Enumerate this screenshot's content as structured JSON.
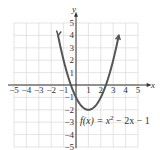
{
  "chart_data": {
    "type": "line",
    "title": "",
    "function_label": "f(x) = x² − 2x − 1",
    "equation": {
      "prefix": "f(x) = x",
      "exp": "2",
      "suffix": " − 2x − 1"
    },
    "xlabel": "x",
    "ylabel": "y",
    "xlim": [
      -5,
      5
    ],
    "ylim": [
      -5,
      5
    ],
    "x_ticks": [
      "−5",
      "−4",
      "−3",
      "−2",
      "−1",
      "1",
      "2",
      "3",
      "4",
      "5"
    ],
    "y_ticks": [
      "5",
      "4",
      "3",
      "2",
      "1",
      "−1",
      "−2",
      "−3",
      "−4",
      "−5"
    ],
    "grid": true,
    "series": [
      {
        "name": "f(x) = x^2 - 2x - 1",
        "x": [
          -1.45,
          -1,
          -0.5,
          0,
          0.5,
          1,
          1.5,
          2,
          2.5,
          3,
          3.45
        ],
        "y": [
          4.0,
          2,
          0.25,
          -1,
          -1.75,
          -2,
          -1.75,
          -1,
          0.25,
          2,
          4.0
        ]
      }
    ],
    "vertex": [
      1,
      -2
    ],
    "colors": {
      "curve": "#555555",
      "grid": "#dddddd",
      "axis": "#333333"
    }
  }
}
